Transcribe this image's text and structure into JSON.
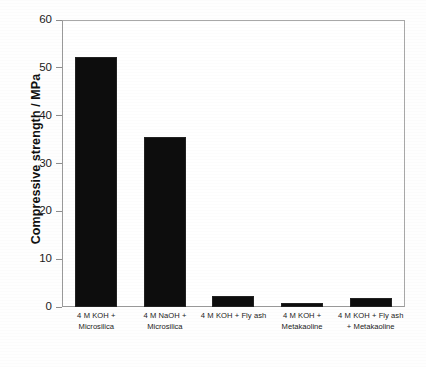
{
  "chart_data": {
    "type": "bar",
    "title": "",
    "xlabel": "",
    "ylabel": "Compressive strength / MPa",
    "ylim": [
      0,
      60
    ],
    "yticks": [
      0,
      10,
      20,
      30,
      40,
      50,
      60
    ],
    "ytick_labels": [
      "0",
      "10",
      "20",
      "30",
      "40",
      "50",
      "60"
    ],
    "grid": false,
    "legend": "none",
    "bar_color": "#0d0d0d",
    "categories": [
      "4 M KOH + Microsilica",
      "4 M NaOH + Microsilica",
      "4 M KOH + Fly ash",
      "4 M KOH + Metakaoline",
      "4 M KOH + Fly ash + Metakaoline"
    ],
    "values": [
      52.3,
      35.5,
      2.4,
      0.8,
      1.9
    ],
    "bars": [
      {
        "label": "4 M KOH + Microsilica",
        "value": 52.3
      },
      {
        "label": "4 M NaOH + Microsilica",
        "value": 35.5
      },
      {
        "label": "4 M KOH + Fly ash",
        "value": 2.4
      },
      {
        "label": "4 M KOH + Metakaoline",
        "value": 0.8
      },
      {
        "label": "4 M KOH + Fly ash + Metakaoline",
        "value": 1.9
      }
    ]
  }
}
